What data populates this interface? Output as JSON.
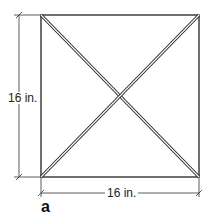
{
  "diagram": {
    "width_label": "16 in.",
    "height_label": "16 in.",
    "figure_label": "a",
    "line_color": "#222222"
  }
}
